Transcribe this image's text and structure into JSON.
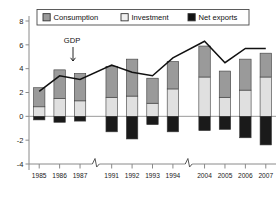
{
  "chart_data": {
    "type": "bar",
    "stacked": true,
    "title": "",
    "xlabel": "",
    "ylabel": "",
    "ylim": [
      -4,
      8
    ],
    "yticks": [
      -4,
      -2,
      0,
      2,
      4,
      6,
      8
    ],
    "ytick_labels": [
      "-4",
      "-2",
      "0",
      "2",
      "4",
      "6",
      "8"
    ],
    "grid": false,
    "legend_position": "top",
    "categories": [
      "1985",
      "1986",
      "1987",
      "1991",
      "1992",
      "1993",
      "1994",
      "2004",
      "2005",
      "2006",
      "2007"
    ],
    "x_tick_labels": [
      "1985",
      "1986",
      "1987",
      "1991",
      "1992",
      "1993",
      "1994",
      "2004",
      "2005",
      "2006",
      "2007"
    ],
    "axis_breaks": [
      "between 1987 and 1991",
      "between 1994 and 2004"
    ],
    "series": [
      {
        "name": "Consumption",
        "color": "#9a9a9a",
        "values": [
          1.6,
          2.4,
          2.3,
          2.6,
          3.1,
          2.1,
          2.3,
          2.6,
          2.2,
          2.6,
          2.0
        ]
      },
      {
        "name": "Investment",
        "color": "#e0e0e0",
        "values": [
          0.8,
          1.5,
          1.3,
          1.6,
          1.7,
          1.1,
          2.3,
          3.3,
          1.6,
          2.2,
          3.3
        ]
      },
      {
        "name": "Net exports",
        "color": "#1a1a1a",
        "values": [
          -0.3,
          -0.5,
          -0.4,
          -1.3,
          -1.9,
          -0.7,
          -1.3,
          -1.2,
          -1.1,
          -1.8,
          -2.4
        ]
      }
    ],
    "gdp_line": {
      "name": "GDP",
      "color": "#111111",
      "annotation": "GDP",
      "values": [
        2.1,
        3.4,
        3.1,
        4.3,
        3.7,
        3.4,
        4.9,
        6.3,
        4.5,
        5.7,
        5.7
      ]
    }
  },
  "legend": {
    "items": [
      {
        "label": "Consumption",
        "color": "#9a9a9a"
      },
      {
        "label": "Investment",
        "color": "#f0f0f0"
      },
      {
        "label": "Net exports",
        "color": "#111111"
      }
    ]
  },
  "annotations": {
    "gdp_label": "GDP"
  }
}
